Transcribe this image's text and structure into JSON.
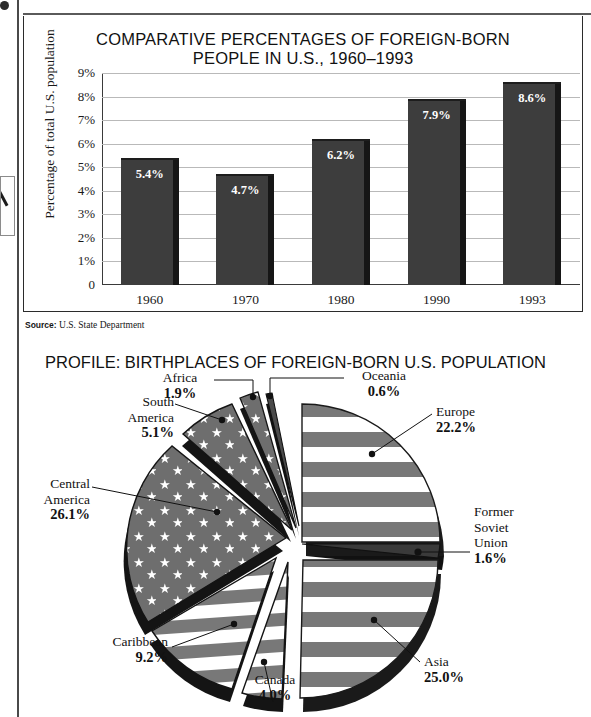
{
  "page": {
    "edge_artifacts": [
      "page-left-rule",
      "page-top-rule",
      "thumb-index-tab",
      "corner-dot"
    ]
  },
  "bar_chart": {
    "title_line1": "COMPARATIVE PERCENTAGES OF FOREIGN-BORN",
    "title_line2": "PEOPLE IN U.S., 1960–1993",
    "y_axis_title": "Percentage of total U.S. population",
    "source_label": "Source:",
    "source_text": "U.S. State Department"
  },
  "pie_chart": {
    "title": "PROFILE: BIRTHPLACES OF FOREIGN-BORN U.S. POPULATION"
  },
  "chart_data": [
    {
      "type": "bar",
      "title": "COMPARATIVE PERCENTAGES OF FOREIGN-BORN PEOPLE IN U.S., 1960–1993",
      "xlabel": "",
      "ylabel": "Percentage of total U.S. population",
      "categories": [
        "1960",
        "1970",
        "1980",
        "1990",
        "1993"
      ],
      "values": [
        5.4,
        4.7,
        6.2,
        7.9,
        8.6
      ],
      "value_labels": [
        "5.4%",
        "4.7%",
        "6.2%",
        "7.9%",
        "8.6%"
      ],
      "ytick_labels": [
        "9%",
        "8%",
        "7%",
        "6%",
        "5%",
        "4%",
        "3%",
        "2%",
        "1%",
        "0"
      ],
      "yticks": [
        9,
        8,
        7,
        6,
        5,
        4,
        3,
        2,
        1,
        0
      ],
      "ylim": [
        0,
        9
      ],
      "grid": true,
      "legend": "none",
      "bar_color": "#3d3d3d",
      "source": "Source: U.S. State Department"
    },
    {
      "type": "pie",
      "title": "PROFILE: BIRTHPLACES OF FOREIGN-BORN U.S. POPULATION",
      "labels": [
        "Central America",
        "Asia",
        "Europe",
        "Caribbean",
        "South America",
        "Canada",
        "Africa",
        "Former Soviet Union",
        "Oceania"
      ],
      "values": [
        26.1,
        25.0,
        22.2,
        9.2,
        5.1,
        4.0,
        1.9,
        1.6,
        0.6
      ],
      "value_labels": [
        "26.1%",
        "25.0%",
        "22.2%",
        "9.2%",
        "5.1%",
        "4.0%",
        "1.9%",
        "1.6%",
        "0.6%"
      ],
      "style": "exploded-3d",
      "fill": "us-flag-pattern",
      "legend": "callout-labels"
    }
  ],
  "pie_labels": [
    {
      "name": "Africa",
      "pct": "1.9%"
    },
    {
      "name": "Oceania",
      "pct": "0.6%"
    },
    {
      "name": "South\nAmerica",
      "pct": "5.1%"
    },
    {
      "name": "Europe",
      "pct": "22.2%"
    },
    {
      "name": "Central\nAmerica",
      "pct": "26.1%"
    },
    {
      "name": "Former\nSoviet\nUnion",
      "pct": "1.6%"
    },
    {
      "name": "Caribbean",
      "pct": "9.2%"
    },
    {
      "name": "Asia",
      "pct": "25.0%"
    },
    {
      "name": "Canada",
      "pct": "4.0%"
    }
  ]
}
